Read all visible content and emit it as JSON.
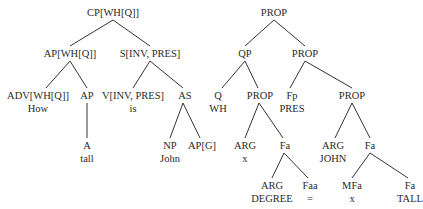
{
  "trees": [
    {
      "name": "syntactic-tree",
      "nodes": [
        {
          "id": "cp",
          "label": "CP[WH[Q]]",
          "x": 113,
          "y": 6
        },
        {
          "id": "apwh",
          "label": "AP[WH[Q]]",
          "x": 70,
          "y": 47
        },
        {
          "id": "sinv",
          "label": "S[INV, PRES]",
          "x": 150,
          "y": 47
        },
        {
          "id": "adv",
          "label": "ADV[WH[Q]]",
          "word": "How",
          "x": 38,
          "y": 89
        },
        {
          "id": "ap",
          "label": "AP",
          "x": 87,
          "y": 89
        },
        {
          "id": "v",
          "label": "V[INV, PRES]",
          "word": "is",
          "x": 133,
          "y": 89
        },
        {
          "id": "as",
          "label": "AS",
          "x": 185,
          "y": 89
        },
        {
          "id": "a",
          "label": "A",
          "word": "tall",
          "x": 87,
          "y": 139
        },
        {
          "id": "np",
          "label": "NP",
          "word": "John",
          "x": 170,
          "y": 139
        },
        {
          "id": "apg",
          "label": "AP[G]",
          "x": 202,
          "y": 139
        }
      ],
      "edges": [
        [
          113,
          20,
          70,
          46
        ],
        [
          113,
          20,
          150,
          46
        ],
        [
          70,
          61,
          46,
          88
        ],
        [
          70,
          61,
          87,
          88
        ],
        [
          150,
          61,
          133,
          88
        ],
        [
          150,
          61,
          183,
          88
        ],
        [
          87,
          103,
          87,
          138
        ],
        [
          183,
          103,
          170,
          138
        ],
        [
          183,
          103,
          200,
          138
        ]
      ]
    },
    {
      "name": "semantic-tree",
      "nodes": [
        {
          "id": "prop0",
          "label": "PROP",
          "x": 274,
          "y": 6
        },
        {
          "id": "qp",
          "label": "QP",
          "x": 245,
          "y": 47
        },
        {
          "id": "prop1",
          "label": "PROP",
          "x": 305,
          "y": 47
        },
        {
          "id": "q",
          "label": "Q",
          "word": "WH",
          "x": 218,
          "y": 89
        },
        {
          "id": "prop2",
          "label": "PROP",
          "x": 260,
          "y": 89
        },
        {
          "id": "fp",
          "label": "Fp",
          "word": "PRES",
          "x": 292,
          "y": 89
        },
        {
          "id": "prop3",
          "label": "PROP",
          "x": 352,
          "y": 89
        },
        {
          "id": "argx",
          "label": "ARG",
          "word": "x",
          "x": 245,
          "y": 139
        },
        {
          "id": "fa1",
          "label": "Fa",
          "x": 285,
          "y": 139
        },
        {
          "id": "argjohn",
          "label": "ARG",
          "word": "JOHN",
          "x": 333,
          "y": 139
        },
        {
          "id": "fa2",
          "label": "Fa",
          "x": 370,
          "y": 139
        },
        {
          "id": "argdeg",
          "label": "ARG",
          "word": "DEGREE",
          "x": 272,
          "y": 179
        },
        {
          "id": "faa",
          "label": "Faa",
          "word": "=",
          "x": 310,
          "y": 179
        },
        {
          "id": "mfa",
          "label": "MFa",
          "word": "x",
          "x": 352,
          "y": 179
        },
        {
          "id": "fatall",
          "label": "Fa",
          "word": "TALL",
          "x": 410,
          "y": 179
        }
      ],
      "edges": [
        [
          274,
          20,
          245,
          46
        ],
        [
          274,
          20,
          305,
          46
        ],
        [
          245,
          61,
          222,
          88
        ],
        [
          245,
          61,
          258,
          88
        ],
        [
          305,
          61,
          290,
          88
        ],
        [
          305,
          61,
          352,
          88
        ],
        [
          259,
          103,
          245,
          138
        ],
        [
          259,
          103,
          283,
          138
        ],
        [
          352,
          103,
          335,
          138
        ],
        [
          352,
          103,
          370,
          138
        ],
        [
          284,
          153,
          272,
          178
        ],
        [
          284,
          153,
          308,
          178
        ],
        [
          370,
          153,
          352,
          178
        ],
        [
          370,
          153,
          408,
          178
        ]
      ]
    }
  ],
  "colors": {
    "ink": "#2a2a2a",
    "line": "#333333",
    "background": "#ffffff"
  }
}
